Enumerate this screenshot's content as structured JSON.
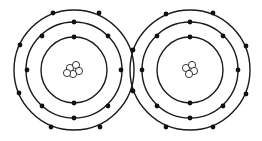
{
  "diagram": {
    "type": "bohr-model-covalent-bond",
    "colors": {
      "line": "#1a1a1a",
      "electron": "#111111",
      "nucleus_fill": "#ffffff",
      "background": "#ffffff"
    },
    "atoms": [
      {
        "name": "left-atom",
        "center": [
          74,
          70
        ],
        "orbits": [
          33,
          48,
          60
        ],
        "electrons": {
          "inner": [
            [
              74,
              37
            ],
            [
              74,
              103
            ]
          ],
          "middle": [
            [
              74,
              22
            ],
            [
              42,
              36
            ],
            [
              108,
              36
            ],
            [
              27,
              70
            ],
            [
              121,
              70
            ],
            [
              42,
              106
            ],
            [
              108,
              106
            ],
            [
              74,
              118
            ]
          ],
          "outer": [
            [
              53,
              13
            ],
            [
              99,
              13
            ],
            [
              20,
              45
            ],
            [
              19,
              93
            ],
            [
              51,
              127
            ],
            [
              100,
              127
            ]
          ]
        },
        "nucleus": [
          [
            70,
            68
          ],
          [
            76,
            65
          ],
          [
            79,
            71
          ],
          [
            73,
            74
          ],
          [
            67,
            73
          ]
        ]
      },
      {
        "name": "right-atom",
        "center": [
          190,
          70
        ],
        "orbits": [
          33,
          48,
          60
        ],
        "electrons": {
          "inner": [
            [
              190,
              37
            ],
            [
              190,
              103
            ]
          ],
          "middle": [
            [
              190,
              22
            ],
            [
              157,
              36
            ],
            [
              223,
              36
            ],
            [
              142,
              70
            ],
            [
              238,
              70
            ],
            [
              157,
              106
            ],
            [
              223,
              106
            ],
            [
              190,
              118
            ]
          ],
          "outer": [
            [
              166,
              14
            ],
            [
              213,
              13
            ],
            [
              246,
              46
            ],
            [
              246,
              94
            ],
            [
              166,
              127
            ],
            [
              213,
              127
            ]
          ]
        },
        "nucleus": [
          [
            186,
            68
          ],
          [
            192,
            65
          ],
          [
            194,
            71
          ],
          [
            189,
            74
          ]
        ]
      }
    ],
    "shared_electrons": [
      [
        133,
        50
      ],
      [
        133,
        91
      ]
    ]
  }
}
